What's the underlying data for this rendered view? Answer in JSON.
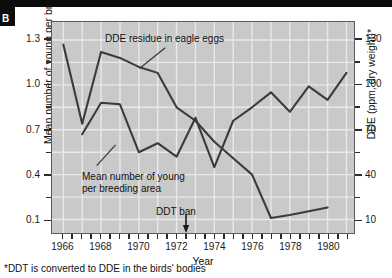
{
  "panel": {
    "letter": "B"
  },
  "footnote": {
    "text": "*DDT is converted to DDE in the birds' bodies"
  },
  "annotations": {
    "dde_label": "DDE residue in eagle eggs",
    "young_label_line1": "Mean number of young",
    "young_label_line2": "per breeding area",
    "ddt_ban_label": "DDT ban"
  },
  "axes": {
    "x_title": "Year",
    "y_left_title": "Mean number of young per breeding area",
    "y_right_title": "DDE (ppm, dry weight)*",
    "x_ticks": [
      "1966",
      "1968",
      "1970",
      "1972",
      "1974",
      "1976",
      "1978",
      "1980"
    ],
    "y_left_ticks": [
      "1.3",
      "1.0",
      "0.7",
      "0.4",
      "0.1"
    ],
    "y_right_ticks": [
      "130",
      "100",
      "70",
      "40",
      "10"
    ]
  },
  "colors": {
    "plot_background": "#c9c9c9",
    "gridline": "#e9e9e9",
    "series_line": "#3b3b3b",
    "frame": "#5a5a5a",
    "panel_box": "#0d0d0d",
    "text": "#111111"
  },
  "chart_data": {
    "type": "line",
    "title": "",
    "xlabel": "Year",
    "ylabel": "Mean number of young per breeding area",
    "ylabel_right": "DDE (ppm, dry weight)*",
    "xlim": [
      1965.4,
      1981.4
    ],
    "ylim_left": [
      0.01,
      1.42
    ],
    "ylim_right": [
      1,
      142
    ],
    "y_left_ticks": [
      1.3,
      1.0,
      0.7,
      0.4,
      0.1
    ],
    "y_right_ticks": [
      130,
      100,
      70,
      40,
      10
    ],
    "x_ticks": [
      1966,
      1968,
      1970,
      1972,
      1974,
      1976,
      1978,
      1980
    ],
    "x_minor_tick_step": 0.5,
    "grid": true,
    "legend": "annotations-inline",
    "annotation_markers": [
      {
        "label": "DDT ban",
        "x": 1972.5,
        "type": "down-arrow"
      }
    ],
    "series": [
      {
        "name": "DDE residue in eagle eggs",
        "axis": "right",
        "units": "ppm, dry weight",
        "x": [
          1966,
          1967,
          1968,
          1969,
          1970,
          1971,
          1972,
          1973,
          1974,
          1975,
          1976,
          1977,
          1978,
          1980
        ],
        "values": [
          127,
          74,
          122,
          118,
          112,
          108,
          85,
          76,
          62,
          51,
          40,
          11,
          13,
          18
        ]
      },
      {
        "name": "Mean number of young per breeding area",
        "axis": "left",
        "units": "young per breeding area",
        "x": [
          1967,
          1968,
          1969,
          1970,
          1971,
          1972,
          1973,
          1974,
          1975,
          1976,
          1977,
          1978,
          1979,
          1980,
          1981
        ],
        "values": [
          0.67,
          0.88,
          0.87,
          0.55,
          0.61,
          0.52,
          0.78,
          0.45,
          0.76,
          0.85,
          0.95,
          0.82,
          0.99,
          0.9,
          1.08
        ]
      }
    ]
  }
}
